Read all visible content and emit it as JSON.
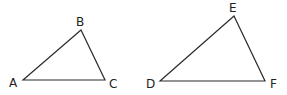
{
  "diagram": {
    "background": "#ffffff",
    "stroke_color": "#2a2a2a",
    "triangles": [
      {
        "name": "ABC",
        "vertices": [
          {
            "label": "A",
            "x": 23,
            "y": 80,
            "lx": 9,
            "ly": 87
          },
          {
            "label": "B",
            "x": 81,
            "y": 30,
            "lx": 76,
            "ly": 26
          },
          {
            "label": "C",
            "x": 105,
            "y": 80,
            "lx": 109,
            "ly": 88
          }
        ]
      },
      {
        "name": "DEF",
        "vertices": [
          {
            "label": "D",
            "x": 160,
            "y": 81,
            "lx": 146,
            "ly": 88
          },
          {
            "label": "E",
            "x": 234,
            "y": 16,
            "lx": 229,
            "ly": 12
          },
          {
            "label": "F",
            "x": 265,
            "y": 81,
            "lx": 270,
            "ly": 88
          }
        ]
      }
    ]
  }
}
